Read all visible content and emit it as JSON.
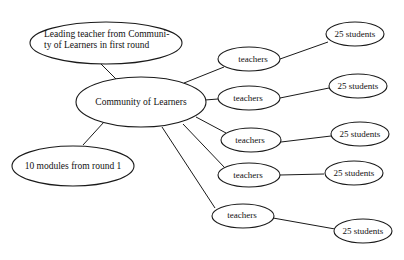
{
  "diagram": {
    "type": "mind-map",
    "nodes": {
      "leading_teacher": {
        "line1": "Leading teacher from Communi-",
        "line2": "ty of Learners in first round"
      },
      "community": {
        "label": "Community of Learners"
      },
      "modules": {
        "label": "10 modules from round 1"
      },
      "teachers": [
        {
          "label": "teachers"
        },
        {
          "label": "teachers"
        },
        {
          "label": "teachers"
        },
        {
          "label": "teachers"
        },
        {
          "label": "teachers"
        }
      ],
      "students": [
        {
          "label": "25 students"
        },
        {
          "label": "25 students"
        },
        {
          "label": "25 students"
        },
        {
          "label": "25 students"
        },
        {
          "label": "25 students"
        }
      ]
    },
    "edges": [
      [
        "leading_teacher",
        "community"
      ],
      [
        "community",
        "modules"
      ],
      [
        "community",
        "teachers.0"
      ],
      [
        "community",
        "teachers.1"
      ],
      [
        "community",
        "teachers.2"
      ],
      [
        "community",
        "teachers.3"
      ],
      [
        "community",
        "teachers.4"
      ],
      [
        "teachers.0",
        "students.0"
      ],
      [
        "teachers.1",
        "students.1"
      ],
      [
        "teachers.2",
        "students.2"
      ],
      [
        "teachers.3",
        "students.3"
      ],
      [
        "teachers.4",
        "students.4"
      ]
    ]
  }
}
